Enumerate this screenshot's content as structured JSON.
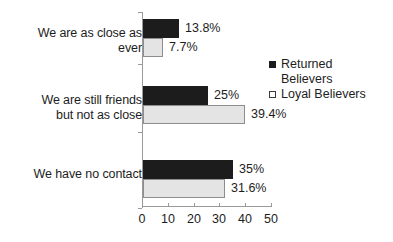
{
  "chart_data": {
    "type": "bar",
    "orientation": "horizontal",
    "title": "",
    "xlabel": "",
    "ylabel": "",
    "xlim": [
      0,
      50
    ],
    "grid": false,
    "legend_position": "right",
    "categories": [
      "We are as close as ever",
      "We are still friends but not as close",
      "We have no contact"
    ],
    "category_lines": [
      [
        "We are as close as",
        "ever"
      ],
      [
        "We are still friends",
        "but not as close"
      ],
      [
        "We have no contact"
      ]
    ],
    "tick_labels": [
      "0",
      "10",
      "20",
      "30",
      "40",
      "50"
    ],
    "tick_values": [
      0,
      10,
      20,
      30,
      40,
      50
    ],
    "series": [
      {
        "name": "Returned Believers",
        "color": "#1c1c1c",
        "values": [
          13.8,
          25,
          35
        ],
        "labels": [
          "13.8%",
          "25%",
          "35%"
        ]
      },
      {
        "name": "Loyal Believers",
        "color": "#e4e4e4",
        "values": [
          7.7,
          39.4,
          31.6
        ],
        "labels": [
          "7.7%",
          "39.4%",
          "31.6%"
        ]
      }
    ]
  },
  "legend": {
    "entries": [
      {
        "label_line1": "Returned",
        "label_line2": "Believers"
      },
      {
        "label_line1": "Loyal Believers",
        "label_line2": ""
      }
    ]
  }
}
